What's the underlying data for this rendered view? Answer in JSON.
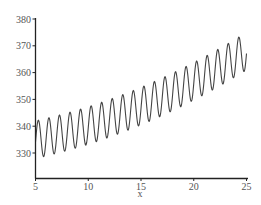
{
  "chart_data": {
    "type": "line",
    "title": "",
    "xlabel": "x",
    "ylabel": "",
    "xlim": [
      5,
      25
    ],
    "ylim": [
      321,
      380
    ],
    "xticks": [
      5,
      10,
      15,
      20,
      25
    ],
    "yticks": [
      330,
      340,
      350,
      360,
      370,
      380
    ],
    "xtick_labels": [
      "5",
      "10",
      "15",
      "20",
      "25"
    ],
    "ytick_labels": [
      "330",
      "340",
      "350",
      "360",
      "370",
      "380"
    ],
    "grid": false,
    "legend": null,
    "line_color": "#444444",
    "model": {
      "trend_base": 335,
      "trend_linear": 0.85,
      "trend_quadratic": 0.04,
      "amplitude": 7,
      "period": 1,
      "phase": 0.27
    },
    "series": [
      {
        "name": "y",
        "points": []
      }
    ],
    "peaks_approx": [
      {
        "x": 5.2,
        "y": 342
      },
      {
        "x": 15.0,
        "y": 354
      },
      {
        "x": 24.6,
        "y": 375
      }
    ],
    "troughs_approx": [
      {
        "x": 5.7,
        "y": 328
      },
      {
        "x": 15.5,
        "y": 340
      },
      {
        "x": 25.0,
        "y": 361
      }
    ]
  }
}
